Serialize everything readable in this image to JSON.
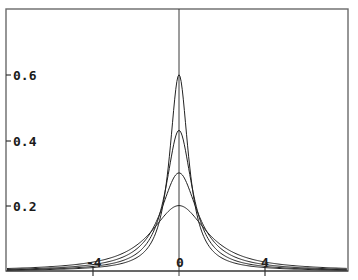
{
  "chart_data": {
    "type": "line",
    "title": "",
    "xlabel": "",
    "ylabel": "",
    "xlim": [
      -8,
      7.8
    ],
    "ylim": [
      0,
      0.75
    ],
    "grid": false,
    "legend": null,
    "x_ticks": [
      -4,
      0,
      4
    ],
    "x_tick_labels": [
      "-4",
      "0",
      "4"
    ],
    "y_ticks": [
      0.2,
      0.4,
      0.6
    ],
    "y_tick_labels": [
      "0.2",
      "0.4",
      "0.6"
    ],
    "series": [
      {
        "name": "curve-1",
        "peak": 0.6,
        "gamma": 0.531
      },
      {
        "name": "curve-2",
        "peak": 0.43,
        "gamma": 0.74
      },
      {
        "name": "curve-3",
        "peak": 0.3,
        "gamma": 1.061
      },
      {
        "name": "curve-4",
        "peak": 0.2,
        "gamma": 1.592
      }
    ],
    "sample_x": [
      -8,
      -6,
      -4,
      -2,
      -1,
      -0.5,
      0,
      0.5,
      1,
      2,
      4,
      6,
      7.8
    ],
    "sample_values": {
      "curve-1": [
        0.005,
        0.009,
        0.01,
        0.037,
        0.131,
        0.318,
        0.6,
        0.318,
        0.131,
        0.037,
        0.01,
        0.005,
        0.003
      ],
      "curve-2": [
        0.004,
        0.006,
        0.014,
        0.051,
        0.152,
        0.293,
        0.43,
        0.293,
        0.152,
        0.051,
        0.014,
        0.006,
        0.004
      ],
      "curve-3": [
        0.005,
        0.009,
        0.019,
        0.066,
        0.158,
        0.246,
        0.3,
        0.246,
        0.158,
        0.066,
        0.019,
        0.009,
        0.005
      ],
      "curve-4": [
        0.008,
        0.013,
        0.027,
        0.078,
        0.143,
        0.182,
        0.2,
        0.182,
        0.143,
        0.078,
        0.027,
        0.013,
        0.008
      ]
    }
  },
  "layout": {
    "frame": {
      "left": 6,
      "top": 9,
      "right": 348,
      "bottom": 271
    },
    "x_origin_px": 179,
    "px_per_x_unit": 21.5,
    "y_zero_px": 271,
    "px_per_y_unit": 327
  },
  "labels": {
    "y": [
      "0.6",
      "0.4",
      "0.2"
    ],
    "x": [
      "-4",
      "0",
      "4"
    ]
  }
}
